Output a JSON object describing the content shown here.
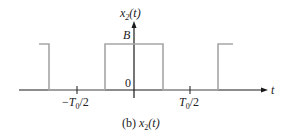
{
  "diagram": {
    "y_axis_label": {
      "base": "x",
      "sub": "2",
      "arg": "(t)"
    },
    "x_axis_label": "t",
    "level_high_label": "B",
    "origin_label": "0",
    "tick_left": {
      "prefix": "−",
      "base": "T",
      "sub": "0",
      "suffix": "/2"
    },
    "tick_right": {
      "base": "T",
      "sub": "0",
      "suffix": "/2"
    },
    "caption": {
      "prefix": "(b) ",
      "base": "x",
      "sub": "2",
      "arg": "(t)"
    },
    "colors": {
      "axis": "#1a1a1a",
      "signal": "#a6a6a6"
    }
  }
}
